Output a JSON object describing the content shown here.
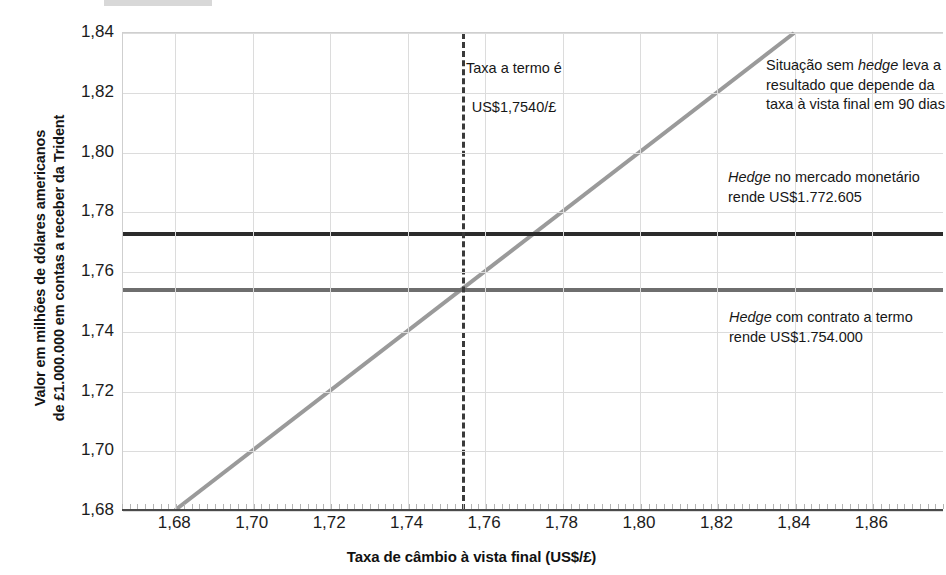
{
  "chart_data": {
    "type": "line",
    "title": "",
    "xlabel": "Taxa de câmbio à vista final (US$/£)",
    "ylabel_line1": "Valor em milhões de dólares americanos",
    "ylabel_line2": "de £1.000.000 em contas a receber da Trident",
    "xlim": [
      1.6665,
      1.8785
    ],
    "ylim": [
      1.68,
      1.84
    ],
    "xticks": [
      "1,68",
      "1,70",
      "1,72",
      "1,74",
      "1,76",
      "1,78",
      "1,80",
      "1,82",
      "1,84",
      "1,86"
    ],
    "xtick_values": [
      1.68,
      1.7,
      1.72,
      1.74,
      1.76,
      1.78,
      1.8,
      1.82,
      1.84,
      1.86
    ],
    "yticks": [
      "1,68",
      "1,70",
      "1,72",
      "1,74",
      "1,76",
      "1,78",
      "1,80",
      "1,82",
      "1,84"
    ],
    "ytick_values": [
      1.68,
      1.7,
      1.72,
      1.74,
      1.76,
      1.78,
      1.8,
      1.82,
      1.84
    ],
    "grid": true,
    "legend_position": "inline-annotations",
    "series": [
      {
        "name": "Hedge no mercado monetário",
        "type": "horizontal-line",
        "value": 1.772605,
        "color": "#2b2b2b",
        "label": "Hedge no mercado monetário rende US$1.772.605"
      },
      {
        "name": "Hedge com contrato a termo",
        "type": "horizontal-line",
        "value": 1.754,
        "color": "#6e6e6e",
        "label": "Hedge com contrato a termo rende US$1.754.000"
      },
      {
        "name": "Situação sem hedge",
        "type": "diagonal-line",
        "color": "#9a9a9a",
        "x": [
          1.68,
          1.84
        ],
        "y": [
          1.68,
          1.84
        ],
        "label": "Situação sem hedge leva a resultado que depende da taxa à vista final em 90 dias"
      },
      {
        "name": "Taxa a termo",
        "type": "vertical-dashed-line",
        "value": 1.754,
        "color": "#3a3a3a",
        "label": "Taxa a termo é US$1,7540/£"
      }
    ],
    "annotations": {
      "forward_rate": {
        "line1": "Taxa a termo é",
        "line2": "US$1,7540/£",
        "full": "Taxa a termo é\nUS$1,7540/£"
      },
      "unhedged": {
        "prefix": "Situação sem ",
        "emphasis": "hedge",
        "suffix": " leva a resultado que depende da taxa à vista final em 90 dias"
      },
      "money_market": {
        "emphasis": "Hedge",
        "suffix": " no mercado monetário rende US$1.772.605"
      },
      "forward_contract": {
        "emphasis": "Hedge",
        "suffix": " com contrato a termo rende US$1.754.000"
      }
    }
  },
  "colors": {
    "money_market_line": "#2b2b2b",
    "forward_line": "#6e6e6e",
    "unhedged_line": "#9a9a9a",
    "dashed_line": "#3a3a3a",
    "grid": "#dcdcdc",
    "axis": "#4a4a4a",
    "text": "#171717"
  }
}
